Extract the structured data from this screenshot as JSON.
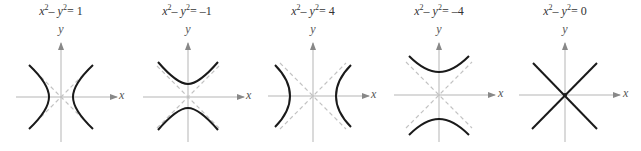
{
  "figure": {
    "panels": [
      {
        "eq_lhs": "x",
        "eq_mid": "2",
        "eq_minus": "– ",
        "eq_y": "y",
        "eq_exp": "2",
        "eq_rhs": "= 1",
        "equation": "x^2 - y^2 = 1",
        "y_label": "y",
        "x_label": "x",
        "orientation": "horizontal",
        "a": 1
      },
      {
        "eq_lhs": "x",
        "eq_mid": "2",
        "eq_minus": "– ",
        "eq_y": "y",
        "eq_exp": "2",
        "eq_rhs": "= –1",
        "equation": "x^2 - y^2 = -1",
        "y_label": "y",
        "x_label": "x",
        "orientation": "vertical",
        "a": 1
      },
      {
        "eq_lhs": "x",
        "eq_mid": "2",
        "eq_minus": "– ",
        "eq_y": "y",
        "eq_exp": "2",
        "eq_rhs": "= 4",
        "equation": "x^2 - y^2 = 4",
        "y_label": "y",
        "x_label": "x",
        "orientation": "horizontal",
        "a": 2
      },
      {
        "eq_lhs": "x",
        "eq_mid": "2",
        "eq_minus": "– ",
        "eq_y": "y",
        "eq_exp": "2",
        "eq_rhs": "= –4",
        "equation": "x^2 - y^2 = -4",
        "y_label": "y",
        "x_label": "x",
        "orientation": "vertical",
        "a": 2
      },
      {
        "eq_lhs": "x",
        "eq_mid": "2",
        "eq_minus": "– ",
        "eq_y": "y",
        "eq_exp": "2",
        "eq_rhs": "= 0",
        "equation": "x^2 - y^2 = 0",
        "y_label": "y",
        "x_label": "x",
        "orientation": "degenerate",
        "a": 0
      }
    ],
    "colors": {
      "curve": "#1a1a1a",
      "axis": "#b0b0b0",
      "asymptote": "#bdbdbd",
      "text": "#333333"
    }
  }
}
